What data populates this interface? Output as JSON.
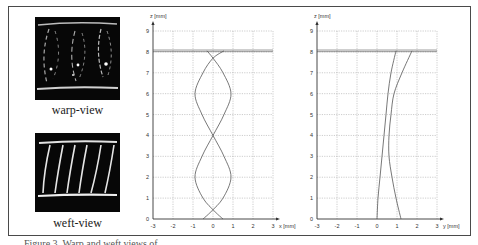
{
  "figure": {
    "panels": {
      "warp": {
        "label": "warp-view"
      },
      "weft": {
        "label": "weft-view"
      }
    },
    "caption": "Figure 3. Warp and weft views of ..."
  },
  "chart_data": [
    {
      "type": "line",
      "title": "",
      "xlabel": "x [mm]",
      "ylabel": "z [mm]",
      "xlim": [
        -3,
        3
      ],
      "ylim": [
        0,
        9
      ],
      "x_ticks": [
        "-3",
        "-2",
        "-1",
        "0",
        "1",
        "2",
        "3"
      ],
      "y_ticks": [
        "0",
        "1",
        "2",
        "3",
        "4",
        "5",
        "6",
        "7",
        "8",
        "9"
      ],
      "grid": true,
      "reference_line": {
        "z": 8.05,
        "label": "top surface"
      },
      "series": [
        {
          "name": "yarn A",
          "points": [
            [
              -0.5,
              0
            ],
            [
              -0.1,
              0.35
            ],
            [
              0.5,
              1
            ],
            [
              0.9,
              2
            ],
            [
              0.55,
              3
            ],
            [
              0,
              4
            ],
            [
              -0.55,
              5
            ],
            [
              -0.9,
              6
            ],
            [
              -0.5,
              7
            ],
            [
              0,
              7.7
            ],
            [
              0.55,
              8.05
            ]
          ]
        },
        {
          "name": "yarn B",
          "points": [
            [
              0.5,
              0
            ],
            [
              0.1,
              0.35
            ],
            [
              -0.5,
              1
            ],
            [
              -0.9,
              2
            ],
            [
              -0.55,
              3
            ],
            [
              0,
              4
            ],
            [
              0.55,
              5
            ],
            [
              0.9,
              6
            ],
            [
              0.5,
              7
            ],
            [
              0,
              7.7
            ],
            [
              -0.3,
              8.05
            ]
          ]
        }
      ]
    },
    {
      "type": "line",
      "title": "",
      "xlabel": "y [mm]",
      "ylabel": "z [mm]",
      "xlim": [
        -3,
        3
      ],
      "ylim": [
        0,
        9
      ],
      "x_ticks": [
        "-3",
        "-2",
        "-1",
        "0",
        "1",
        "2",
        "3"
      ],
      "y_ticks": [
        "0",
        "1",
        "2",
        "3",
        "4",
        "5",
        "6",
        "7",
        "8",
        "9"
      ],
      "grid": true,
      "reference_line": {
        "z": 8.05,
        "label": "top surface"
      },
      "series": [
        {
          "name": "yarn A",
          "points": [
            [
              0,
              0
            ],
            [
              0.05,
              1
            ],
            [
              0.15,
              2
            ],
            [
              0.25,
              3
            ],
            [
              0.35,
              4
            ],
            [
              0.45,
              5
            ],
            [
              0.55,
              6
            ],
            [
              0.7,
              7
            ],
            [
              0.95,
              8.05
            ]
          ]
        },
        {
          "name": "yarn B",
          "points": [
            [
              1.2,
              0
            ],
            [
              0.95,
              1
            ],
            [
              0.75,
              2
            ],
            [
              0.6,
              3
            ],
            [
              0.6,
              4
            ],
            [
              0.7,
              5
            ],
            [
              0.85,
              6
            ],
            [
              1.25,
              7
            ],
            [
              1.75,
              8.05
            ]
          ]
        }
      ]
    }
  ]
}
